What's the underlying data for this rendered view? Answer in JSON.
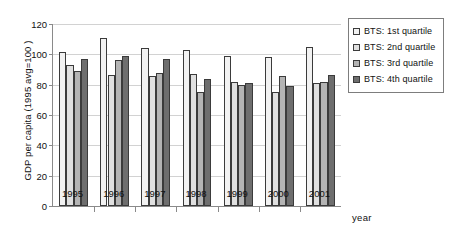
{
  "chart_data": {
    "type": "bar",
    "title": "",
    "subtitle": "",
    "xlabel": "year",
    "ylabel": "GDP per capita (1995 avg=100 )",
    "categories": [
      "1995",
      "1996",
      "1997",
      "1998",
      "1999",
      "2000",
      "2001"
    ],
    "ylim": [
      0,
      120
    ],
    "yticks": [
      0,
      20,
      40,
      60,
      80,
      100,
      120
    ],
    "grid": "horizontal",
    "legend_position": "right",
    "series": [
      {
        "name": "BTS: 1st quartile",
        "color": "#f2f2f2",
        "values": [
          101.5,
          111.0,
          104.0,
          103.0,
          99.0,
          98.0,
          105.0
        ]
      },
      {
        "name": "BTS: 2nd quartile",
        "color": "#e0e0e0",
        "values": [
          93.0,
          86.5,
          86.0,
          87.0,
          81.5,
          75.5,
          81.0
        ]
      },
      {
        "name": "BTS: 3rd quartile",
        "color": "#b4b4b4",
        "values": [
          89.0,
          96.0,
          87.5,
          75.5,
          80.0,
          86.0,
          82.0
        ]
      },
      {
        "name": "BTS: 4th quartile",
        "color": "#6e6e6e",
        "values": [
          97.0,
          99.0,
          97.0,
          84.0,
          81.0,
          79.0,
          86.5
        ]
      }
    ]
  },
  "axes": {
    "y_title": "GDP per capita (1995 avg=100 )",
    "x_title": "year",
    "y_tick_labels": [
      "0",
      "20",
      "40",
      "60",
      "80",
      "100",
      "120"
    ],
    "x_tick_labels": [
      "1995",
      "1996",
      "1997",
      "1998",
      "1999",
      "2000",
      "2001"
    ]
  },
  "legend": {
    "items": [
      {
        "label": "BTS: 1st quartile",
        "color": "#f2f2f2"
      },
      {
        "label": "BTS: 2nd quartile",
        "color": "#e0e0e0"
      },
      {
        "label": "BTS: 3rd quartile",
        "color": "#b4b4b4"
      },
      {
        "label": "BTS: 4th quartile",
        "color": "#6e6e6e"
      }
    ]
  }
}
